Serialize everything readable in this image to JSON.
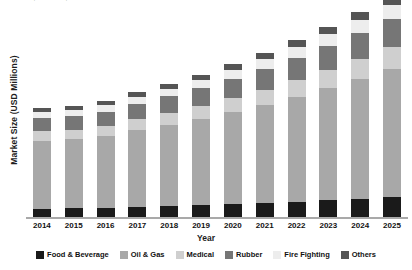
{
  "chart_data": {
    "type": "bar",
    "subtype": "stacked-column",
    "title": "",
    "xlabel": "Year",
    "ylabel": "Market Size (USD Millions)",
    "grid": false,
    "legend_position": "bottom",
    "ylim": [
      0,
      3400
    ],
    "categories": [
      "2014",
      "2015",
      "2016",
      "2017",
      "2018",
      "2019",
      "2020",
      "2021",
      "2022",
      "2023",
      "2024",
      "2025"
    ],
    "series": [
      {
        "name": "Food & Beverage",
        "color": "#1a1a1a",
        "values": [
          150,
          155,
          163,
          178,
          190,
          205,
          222,
          240,
          262,
          285,
          310,
          338
        ]
      },
      {
        "name": "Oil & Gas",
        "color": "#a8a8a8",
        "values": [
          1080,
          1095,
          1140,
          1215,
          1290,
          1370,
          1460,
          1555,
          1665,
          1780,
          1905,
          2035
        ]
      },
      {
        "name": "Medical",
        "color": "#cfcfcf",
        "values": [
          150,
          155,
          163,
          178,
          192,
          208,
          226,
          245,
          267,
          290,
          316,
          344
        ]
      },
      {
        "name": "Rubber",
        "color": "#767676",
        "values": [
          210,
          215,
          225,
          243,
          260,
          280,
          302,
          325,
          352,
          380,
          412,
          445
        ]
      },
      {
        "name": "Fire Fighting",
        "color": "#ededed",
        "values": [
          96,
          98,
          104,
          114,
          124,
          134,
          146,
          158,
          172,
          187,
          204,
          222
        ]
      },
      {
        "name": "Others",
        "color": "#555555",
        "values": [
          60,
          59,
          63,
          69,
          75,
          81,
          88,
          96,
          104,
          113,
          123,
          134
        ]
      }
    ],
    "point_labels": [
      {
        "category": "2014",
        "text": "1,745.9"
      },
      {
        "category": "2015",
        "text": "1,776.7"
      }
    ],
    "totals": [
      1745.9,
      1776.7,
      1858,
      1997,
      2131,
      2278,
      2444,
      2619,
      2822,
      3035,
      3270,
      3518
    ]
  },
  "legend": {
    "items": [
      {
        "label": "Food & Beverage",
        "color": "#1a1a1a",
        "icon": "legend-swatch"
      },
      {
        "label": "Oil & Gas",
        "color": "#a8a8a8",
        "icon": "legend-swatch"
      },
      {
        "label": "Medical",
        "color": "#cfcfcf",
        "icon": "legend-swatch"
      },
      {
        "label": "Rubber",
        "color": "#767676",
        "icon": "legend-swatch"
      },
      {
        "label": "Fire Fighting",
        "color": "#ededed",
        "icon": "legend-swatch"
      },
      {
        "label": "Others",
        "color": "#555555",
        "icon": "legend-swatch"
      }
    ]
  }
}
